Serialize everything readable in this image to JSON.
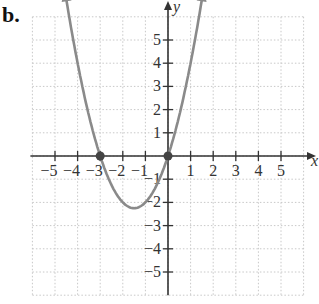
{
  "part_label": "b.",
  "chart_data": {
    "type": "line",
    "title": "",
    "xlabel": "x",
    "ylabel": "y",
    "xlim": [
      -6,
      6
    ],
    "ylim": [
      -6,
      6
    ],
    "grid": true,
    "x_ticks": [
      "-5",
      "-4",
      "-3",
      "-2",
      "-1",
      "1",
      "2",
      "3",
      "4",
      "5"
    ],
    "y_ticks": [
      "5",
      "4",
      "3",
      "2",
      "1",
      "-1",
      "-2",
      "-3",
      "-4",
      "-5"
    ],
    "series": [
      {
        "name": "y = x^2 + 3x",
        "color": "#8a8a8a",
        "x": [
          -4.6,
          -4,
          -3,
          -2,
          -1.5,
          -1,
          0,
          1,
          1.6
        ],
        "y": [
          7.36,
          4,
          0,
          -2,
          -2.25,
          -2,
          0,
          4,
          7.36
        ]
      }
    ],
    "points": [
      {
        "x": -3,
        "y": 0
      },
      {
        "x": 0,
        "y": 0
      }
    ],
    "annotations": [
      "arrows at both ends of curve"
    ]
  }
}
